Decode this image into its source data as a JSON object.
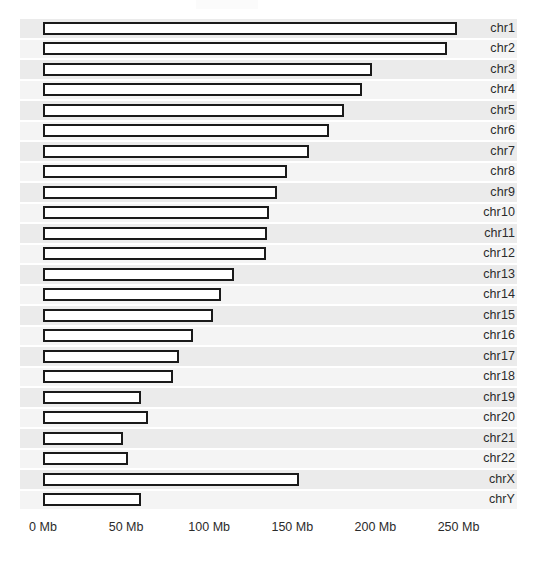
{
  "chart_data": {
    "type": "bar",
    "orientation": "horizontal",
    "title": "",
    "subtitle": "",
    "xlabel": "",
    "ylabel": "",
    "xlim": [
      0,
      265
    ],
    "ylim": null,
    "grid": false,
    "legend": null,
    "legend_position": "none",
    "x_tick_labels": [
      "0 Mb",
      "50 Mb",
      "100 Mb",
      "150 Mb",
      "200 Mb",
      "250 Mb"
    ],
    "x_tick_values": [
      0,
      50,
      100,
      150,
      200,
      250
    ],
    "unit": "Mb",
    "categories": [
      "chr1",
      "chr2",
      "chr3",
      "chr4",
      "chr5",
      "chr6",
      "chr7",
      "chr8",
      "chr9",
      "chr10",
      "chr11",
      "chr12",
      "chr13",
      "chr14",
      "chr15",
      "chr16",
      "chr17",
      "chr18",
      "chr19",
      "chr20",
      "chr21",
      "chr22",
      "chrX",
      "chrY"
    ],
    "values": [
      249,
      243,
      198,
      192,
      181,
      172,
      160,
      147,
      141,
      136,
      135,
      134,
      115,
      107,
      102,
      90,
      82,
      78,
      59,
      63,
      48,
      51,
      154,
      59
    ],
    "bar_fill_color": "#ffffff",
    "bar_border_color": "#1a1a1a",
    "panel_stripe_color": "#ebebeb",
    "background_color": "#ffffff",
    "text_color": "#2b2b2b"
  },
  "axis": {
    "ticks": [
      {
        "label": "0 Mb",
        "value": 0
      },
      {
        "label": "50 Mb",
        "value": 50
      },
      {
        "label": "100 Mb",
        "value": 100
      },
      {
        "label": "150 Mb",
        "value": 150
      },
      {
        "label": "200 Mb",
        "value": 200
      },
      {
        "label": "250 Mb",
        "value": 250
      }
    ]
  },
  "rows": [
    {
      "label": "chr1",
      "value": 249
    },
    {
      "label": "chr2",
      "value": 243
    },
    {
      "label": "chr3",
      "value": 198
    },
    {
      "label": "chr4",
      "value": 192
    },
    {
      "label": "chr5",
      "value": 181
    },
    {
      "label": "chr6",
      "value": 172
    },
    {
      "label": "chr7",
      "value": 160
    },
    {
      "label": "chr8",
      "value": 147
    },
    {
      "label": "chr9",
      "value": 141
    },
    {
      "label": "chr10",
      "value": 136
    },
    {
      "label": "chr11",
      "value": 135
    },
    {
      "label": "chr12",
      "value": 134
    },
    {
      "label": "chr13",
      "value": 115
    },
    {
      "label": "chr14",
      "value": 107
    },
    {
      "label": "chr15",
      "value": 102
    },
    {
      "label": "chr16",
      "value": 90
    },
    {
      "label": "chr17",
      "value": 82
    },
    {
      "label": "chr18",
      "value": 78
    },
    {
      "label": "chr19",
      "value": 59
    },
    {
      "label": "chr20",
      "value": 63
    },
    {
      "label": "chr21",
      "value": 48
    },
    {
      "label": "chr22",
      "value": 51
    },
    {
      "label": "chrX",
      "value": 154
    },
    {
      "label": "chrY",
      "value": 59
    }
  ]
}
